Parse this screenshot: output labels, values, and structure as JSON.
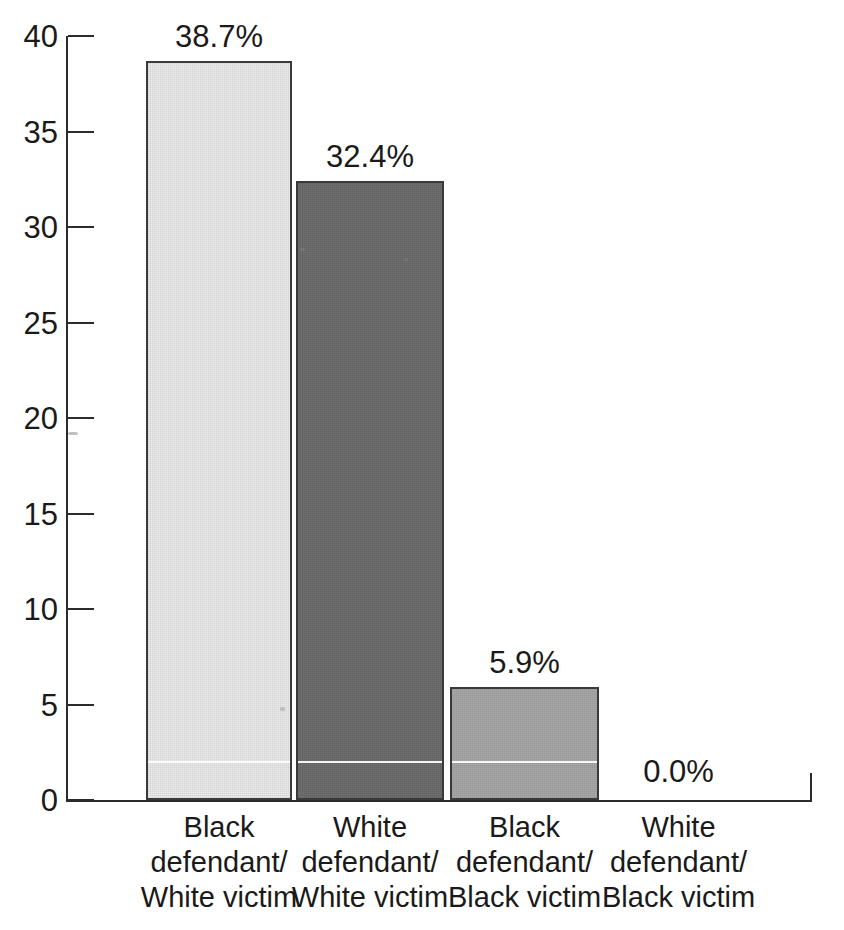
{
  "chart_data": {
    "type": "bar",
    "title": "",
    "xlabel": "",
    "ylabel": "",
    "ylim": [
      0,
      40
    ],
    "ytick_step": 5,
    "grid": false,
    "legend": null,
    "categories": [
      "Black defendant/ White victim",
      "White defendant/ White victim",
      "Black defendant/ Black victim",
      "White defendant/ Black victim"
    ],
    "category_lines": [
      [
        "Black",
        "defendant/",
        "White victim"
      ],
      [
        "White",
        "defendant/",
        "White victim"
      ],
      [
        "Black",
        "defendant/",
        "Black victim"
      ],
      [
        "White",
        "defendant/",
        "Black victim"
      ]
    ],
    "values": [
      38.7,
      32.4,
      5.9,
      0.0
    ],
    "data_labels": [
      "38.7%",
      "32.4%",
      "5.9%",
      "0.0%"
    ],
    "ytick_labels": [
      "0",
      "5",
      "10",
      "15",
      "20",
      "25",
      "30",
      "35",
      "40"
    ],
    "ytick_values": [
      0,
      5,
      10,
      15,
      20,
      25,
      30,
      35,
      40
    ],
    "bar_colors": [
      "#ececec",
      "#6f6f6f",
      "#a9a9a9",
      "#ffffff"
    ],
    "bar_border_color": "#3a3a3a"
  },
  "axis": {
    "line_color": "#2b2b2b"
  }
}
